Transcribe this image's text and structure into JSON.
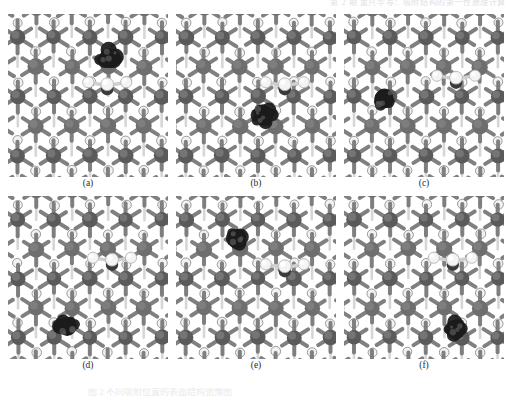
{
  "running_head": {
    "text": "第 2 期        董兴华等：吸附结构的第一性原理计算"
  },
  "figure": {
    "panels": [
      {
        "id": "a",
        "label": "(a)",
        "row": 0,
        "column": 0,
        "cluster_position": "top-right",
        "cluster_center": [
          0.63,
          0.27
        ],
        "molecule_center": [
          0.62,
          0.44
        ],
        "molecule_present": true
      },
      {
        "id": "b",
        "label": "(b)",
        "row": 0,
        "column": 1,
        "cluster_position": "center",
        "cluster_center": [
          0.55,
          0.62
        ],
        "molecule_center": [
          0.68,
          0.44
        ],
        "molecule_present": true
      },
      {
        "id": "c",
        "label": "(c)",
        "row": 0,
        "column": 2,
        "cluster_position": "mid-left",
        "cluster_center": [
          0.25,
          0.52
        ],
        "molecule_center": [
          0.7,
          0.4
        ],
        "molecule_present": true
      },
      {
        "id": "d",
        "label": "(d)",
        "row": 1,
        "column": 0,
        "cluster_position": "bottom-left-center",
        "cluster_center": [
          0.37,
          0.8
        ],
        "molecule_center": [
          0.65,
          0.4
        ],
        "molecule_present": true
      },
      {
        "id": "e",
        "label": "(e)",
        "row": 1,
        "column": 1,
        "cluster_position": "upper-left-center",
        "cluster_center": [
          0.38,
          0.26
        ],
        "molecule_center": [
          0.68,
          0.44
        ],
        "molecule_present": true
      },
      {
        "id": "f",
        "label": "(f)",
        "row": 1,
        "column": 2,
        "cluster_position": "bottom-right",
        "cluster_center": [
          0.7,
          0.82
        ],
        "molecule_center": [
          0.68,
          0.4
        ],
        "molecule_present": true
      }
    ],
    "colors": {
      "substrate_atom": "#6e6e6e",
      "substrate_atom_dark": "#5a5a5a",
      "substrate_atom_light": "#8c8c8c",
      "subsurface_atom": "#f2f2f2",
      "subsurface_outline": "#9a9a9a",
      "bond": "#7a7a7a",
      "bond_light": "#d0d0d0",
      "adsorbate_cluster": "#1b1b1b",
      "molecule_white": "#f4f4f4",
      "molecule_center_dark": "#3a3a3a",
      "background": "#ffffff",
      "label_text": "#2b2b2b"
    },
    "lattice": {
      "rows": 6,
      "columns": 5,
      "description": "hexagonal surface slab, large gray surface atoms with six radial bonds, small white subsurface atoms"
    }
  },
  "caption": {
    "text": "图 2    不同吸附位置的表面结构弛豫图"
  }
}
